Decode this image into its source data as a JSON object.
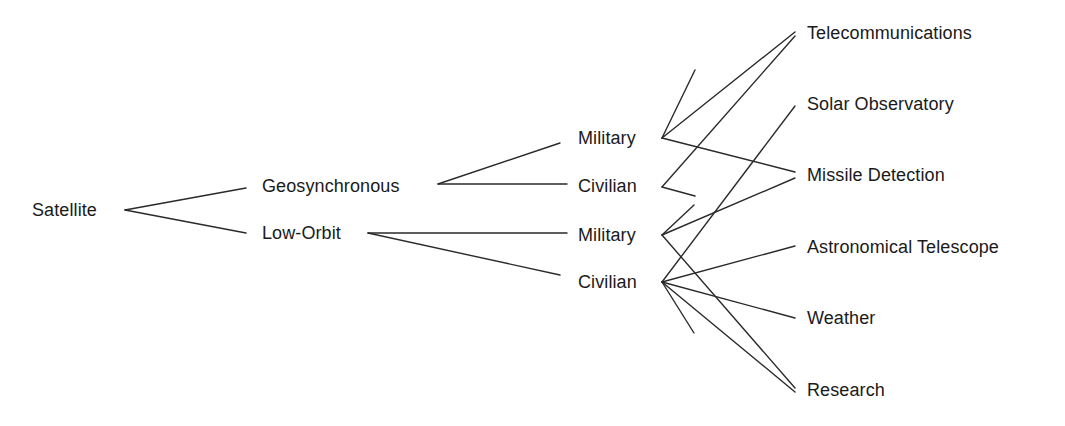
{
  "diagram": {
    "type": "tree",
    "root": "Satellite",
    "nodes": {
      "satellite": {
        "label": "Satellite",
        "x": 32,
        "y": 210
      },
      "geosynchronous": {
        "label": "Geosynchronous",
        "x": 262,
        "y": 186
      },
      "low_orbit": {
        "label": "Low-Orbit",
        "x": 262,
        "y": 233
      },
      "geo_military": {
        "label": "Military",
        "x": 578,
        "y": 138
      },
      "geo_civilian": {
        "label": "Civilian",
        "x": 578,
        "y": 186
      },
      "low_military": {
        "label": "Military",
        "x": 578,
        "y": 235
      },
      "low_civilian": {
        "label": "Civilian",
        "x": 578,
        "y": 282
      },
      "telecommunications": {
        "label": "Telecommunications",
        "x": 807,
        "y": 33
      },
      "solar_observatory": {
        "label": "Solar Observatory",
        "x": 807,
        "y": 104
      },
      "missile_detection": {
        "label": "Missile Detection",
        "x": 807,
        "y": 175
      },
      "astronomical_telescope": {
        "label": "Astronomical Telescope",
        "x": 807,
        "y": 247
      },
      "weather": {
        "label": "Weather",
        "x": 807,
        "y": 318
      },
      "research": {
        "label": "Research",
        "x": 807,
        "y": 390
      }
    },
    "edges": [
      {
        "from": "satellite",
        "to": "geosynchronous",
        "x1": 125,
        "y1": 210,
        "x2": 246,
        "y2": 188
      },
      {
        "from": "satellite",
        "to": "low_orbit",
        "x1": 125,
        "y1": 210,
        "x2": 246,
        "y2": 233
      },
      {
        "from": "geosynchronous",
        "to": "geo_military",
        "x1": 438,
        "y1": 184,
        "x2": 560,
        "y2": 143
      },
      {
        "from": "geosynchronous",
        "to": "geo_civilian",
        "x1": 438,
        "y1": 184,
        "x2": 567,
        "y2": 184
      },
      {
        "from": "low_orbit",
        "to": "low_military",
        "x1": 368,
        "y1": 233,
        "x2": 567,
        "y2": 233
      },
      {
        "from": "low_orbit",
        "to": "low_civilian",
        "x1": 368,
        "y1": 233,
        "x2": 560,
        "y2": 275
      },
      {
        "from": "geo_military",
        "to": "stub",
        "x1": 662,
        "y1": 138,
        "x2": 695,
        "y2": 70
      },
      {
        "from": "geo_military",
        "to": "telecommunications",
        "x1": 662,
        "y1": 138,
        "x2": 795,
        "y2": 32
      },
      {
        "from": "geo_military",
        "to": "missile_detection",
        "x1": 662,
        "y1": 138,
        "x2": 795,
        "y2": 172
      },
      {
        "from": "geo_civilian",
        "to": "telecommunications",
        "x1": 662,
        "y1": 187,
        "x2": 795,
        "y2": 36
      },
      {
        "from": "geo_civilian",
        "to": "stub",
        "x1": 662,
        "y1": 187,
        "x2": 695,
        "y2": 196
      },
      {
        "from": "low_military",
        "to": "stub",
        "x1": 662,
        "y1": 235,
        "x2": 694,
        "y2": 205
      },
      {
        "from": "low_military",
        "to": "missile_detection",
        "x1": 662,
        "y1": 235,
        "x2": 795,
        "y2": 178
      },
      {
        "from": "low_military",
        "to": "research",
        "x1": 662,
        "y1": 235,
        "x2": 795,
        "y2": 388
      },
      {
        "from": "low_civilian",
        "to": "solar_observatory",
        "x1": 662,
        "y1": 282,
        "x2": 795,
        "y2": 106
      },
      {
        "from": "low_civilian",
        "to": "astronomical_telescope",
        "x1": 662,
        "y1": 282,
        "x2": 795,
        "y2": 246
      },
      {
        "from": "low_civilian",
        "to": "weather",
        "x1": 662,
        "y1": 282,
        "x2": 795,
        "y2": 318
      },
      {
        "from": "low_civilian",
        "to": "research",
        "x1": 662,
        "y1": 282,
        "x2": 795,
        "y2": 392
      },
      {
        "from": "low_civilian",
        "to": "stub",
        "x1": 662,
        "y1": 282,
        "x2": 694,
        "y2": 333
      }
    ]
  }
}
